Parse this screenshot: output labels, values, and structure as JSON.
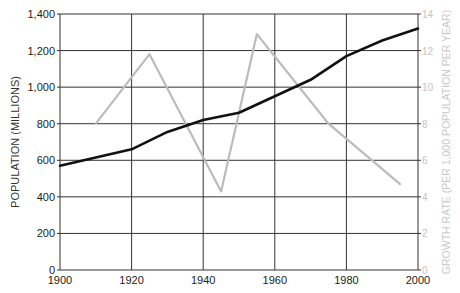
{
  "chart_data": {
    "type": "line",
    "title": "",
    "xlabel": "",
    "ylabel": "POPULATION (MILLIONS)",
    "ylabel_right": "GROWTH RATE (PER 1,000 POPULATION PER YEAR)",
    "xlim": [
      1900,
      2000
    ],
    "ylim": [
      0,
      1400
    ],
    "ylim_right": [
      0,
      14
    ],
    "grid": true,
    "legend": null,
    "x_ticks": [
      "1900",
      "1920",
      "1940",
      "1960",
      "1980",
      "2000"
    ],
    "y_ticks_left": [
      "0",
      "200",
      "400",
      "600",
      "800",
      "1,000",
      "1,200",
      "1,400"
    ],
    "y_ticks_right": [
      "0",
      "2",
      "4",
      "6",
      "8",
      "10",
      "12",
      "14"
    ],
    "series": [
      {
        "name": "Population (millions)",
        "axis": "left",
        "color": "#111111",
        "x": [
          1900,
          1910,
          1920,
          1930,
          1940,
          1950,
          1960,
          1970,
          1980,
          1990,
          2000
        ],
        "values": [
          570,
          615,
          660,
          755,
          820,
          860,
          950,
          1040,
          1170,
          1255,
          1320
        ]
      },
      {
        "name": "Growth rate (per 1,000 population per year)",
        "axis": "right",
        "color": "#bbbbbb",
        "x": [
          1910,
          1925,
          1945,
          1955,
          1975,
          1995
        ],
        "values": [
          8.0,
          11.8,
          4.3,
          12.9,
          8.0,
          4.7
        ]
      }
    ]
  },
  "layout": {
    "plot_left": 60,
    "plot_right": 418,
    "plot_top": 14,
    "plot_bottom": 270
  }
}
